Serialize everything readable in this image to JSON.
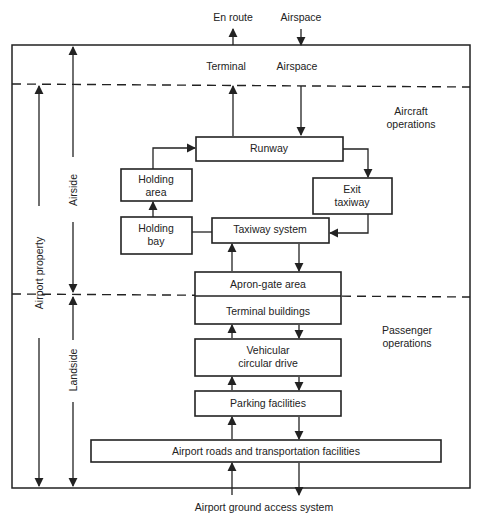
{
  "external": {
    "top_left": "En route",
    "top_right": "Airspace",
    "bottom": "Airport ground access system"
  },
  "zone_labels": {
    "terminal": "Terminal",
    "airspace": "Airspace",
    "aircraft_ops_line1": "Aircraft",
    "aircraft_ops_line2": "operations",
    "passenger_ops_line1": "Passenger",
    "passenger_ops_line2": "operations"
  },
  "dimension_labels": {
    "airport_property": "Airport property",
    "airside": "Airside",
    "landside": "Landside"
  },
  "boxes": {
    "runway": "Runway",
    "holding_area_line1": "Holding",
    "holding_area_line2": "area",
    "exit_taxiway_line1": "Exit",
    "exit_taxiway_line2": "taxiway",
    "holding_bay_line1": "Holding",
    "holding_bay_line2": "bay",
    "taxiway_system": "Taxiway system",
    "apron_gate": "Apron-gate area",
    "terminal_buildings": "Terminal buildings",
    "vehicular_line1": "Vehicular",
    "vehicular_line2": "circular drive",
    "parking": "Parking facilities",
    "roads": "Airport roads and transportation facilities"
  },
  "colors": {
    "ink": "#222222",
    "background": "#ffffff"
  }
}
